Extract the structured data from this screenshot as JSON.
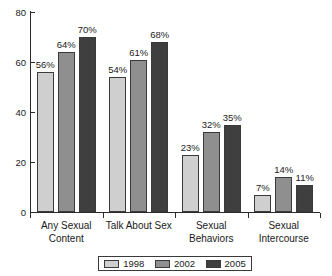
{
  "chart_data": {
    "type": "bar",
    "title": "",
    "xlabel": "",
    "ylabel": "",
    "ylim": [
      0,
      80
    ],
    "yticks": [
      0,
      20,
      40,
      60,
      80
    ],
    "grid": false,
    "legend_position": "bottom",
    "categories": [
      "Any Sexual\nContent",
      "Talk About Sex",
      "Sexual\nBehaviors",
      "Sexual\nIntercourse"
    ],
    "series": [
      {
        "name": "1998",
        "color": "#cfcfcf",
        "values": [
          56,
          54,
          23,
          7
        ],
        "labels": [
          "56%",
          "54%",
          "23%",
          "7%"
        ]
      },
      {
        "name": "2002",
        "color": "#8f8f8f",
        "values": [
          64,
          61,
          32,
          14
        ],
        "labels": [
          "64%",
          "61%",
          "32%",
          "14%"
        ]
      },
      {
        "name": "2005",
        "color": "#3f3f3f",
        "values": [
          70,
          68,
          35,
          11
        ],
        "labels": [
          "70%",
          "68%",
          "35%",
          "11%"
        ]
      }
    ],
    "ytick_labels": [
      "0",
      "20",
      "40",
      "60",
      "80"
    ]
  }
}
